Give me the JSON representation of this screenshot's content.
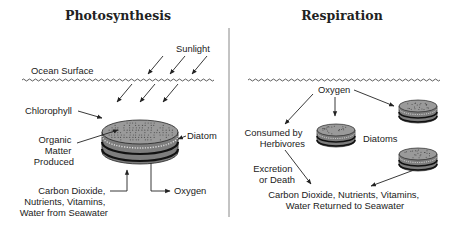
{
  "photosynthesis": {
    "title": "Photosynthesis",
    "labels": {
      "sunlight": "Sunlight",
      "ocean_surface": "Ocean Surface",
      "chlorophyll": "Chlorophyll",
      "organic_matter": [
        "Organic",
        "Matter",
        "Produced"
      ],
      "diatom": "Diatom",
      "inputs": [
        "Carbon Dioxide,",
        "Nutrients, Vitamins,",
        "Water from Seawater"
      ],
      "oxygen": "Oxygen"
    }
  },
  "respiration": {
    "title": "Respiration",
    "labels": {
      "oxygen": "Oxygen",
      "consumed": [
        "Consumed by",
        "Herbivores"
      ],
      "diatoms": "Diatoms",
      "excretion": [
        "Excretion",
        "or Death"
      ],
      "returned": [
        "Carbon Dioxide, Nutrients, Vitamins,",
        "Water Returned to Seawater"
      ]
    }
  },
  "colors": {
    "ink": "#222222",
    "diatom_top": "#9a9a9a",
    "diatom_side": "#7d7d7d",
    "diatom_band": "#2a2a2a"
  }
}
